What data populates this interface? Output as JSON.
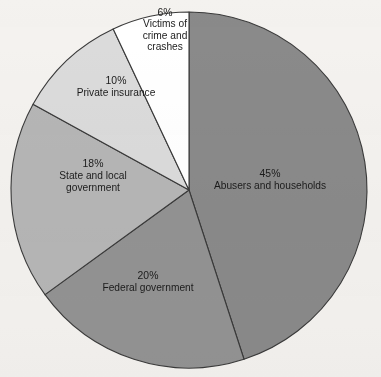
{
  "chart_data": {
    "type": "pie",
    "title": "",
    "subtitle": "",
    "xlabel": "",
    "ylabel": "",
    "legend_position": "none",
    "grid": false,
    "start_angle_deg": 0,
    "direction": "clockwise",
    "center": {
      "x": 189,
      "y": 190
    },
    "radius": 178,
    "categories": [
      "Abusers and households",
      "Federal government",
      "State and local government",
      "Private insurance",
      "Victims of crime and crashes"
    ],
    "values": [
      45,
      20,
      18,
      10,
      6
    ],
    "value_unit": "%",
    "slices": [
      {
        "id": "abusers",
        "label": "Abusers and households",
        "label_lines": [
          "Abusers and households"
        ],
        "percent_text": "45%",
        "value": 45,
        "color": "#8a8a8a",
        "start_deg": 0,
        "end_deg": 162,
        "label_x": 270,
        "label_y": 180
      },
      {
        "id": "federal",
        "label": "Federal government",
        "label_lines": [
          "Federal government"
        ],
        "percent_text": "20%",
        "value": 20,
        "color": "#939393",
        "start_deg": 162,
        "end_deg": 234,
        "label_x": 148,
        "label_y": 282
      },
      {
        "id": "state-local",
        "label": "State and local government",
        "label_lines": [
          "State and local",
          "government"
        ],
        "percent_text": "18%",
        "value": 18,
        "color": "#b6b6b6",
        "start_deg": 234,
        "end_deg": 298.8,
        "label_x": 93,
        "label_y": 176
      },
      {
        "id": "private-insurance",
        "label": "Private insurance",
        "label_lines": [
          "Private insurance"
        ],
        "percent_text": "10%",
        "value": 10,
        "color": "#dbdbdb",
        "start_deg": 298.8,
        "end_deg": 334.8,
        "label_x": 116,
        "label_y": 87
      },
      {
        "id": "victims",
        "label": "Victims of crime and crashes",
        "label_lines": [
          "Victims of",
          "crime and",
          "crashes"
        ],
        "percent_text": "6%",
        "value": 6,
        "color": "#ffffff",
        "start_deg": 334.8,
        "end_deg": 360,
        "label_x": 165,
        "label_y": 30
      }
    ],
    "colors": {
      "background": "#f4f2ef",
      "outline": "#3a3a3a",
      "text": "#1b1b1b"
    }
  }
}
